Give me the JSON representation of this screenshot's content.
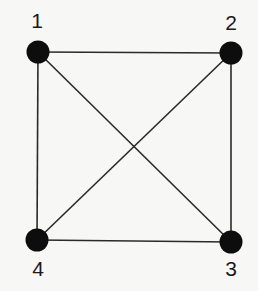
{
  "diagram": {
    "type": "graph",
    "nodes": [
      {
        "id": "1",
        "label": "1",
        "x": 38,
        "y": 52,
        "label_x": 37,
        "label_y": 28
      },
      {
        "id": "2",
        "label": "2",
        "x": 231,
        "y": 53,
        "label_x": 231,
        "label_y": 30
      },
      {
        "id": "3",
        "label": "3",
        "x": 231,
        "y": 242,
        "label_x": 231,
        "label_y": 276
      },
      {
        "id": "4",
        "label": "4",
        "x": 37,
        "y": 240,
        "label_x": 38,
        "label_y": 276
      }
    ],
    "edges": [
      {
        "from": "1",
        "to": "2"
      },
      {
        "from": "2",
        "to": "3"
      },
      {
        "from": "3",
        "to": "4"
      },
      {
        "from": "4",
        "to": "1"
      },
      {
        "from": "1",
        "to": "3"
      },
      {
        "from": "2",
        "to": "4"
      }
    ],
    "colors": {
      "node": "#0d0d0d",
      "edge": "#2a2a2a",
      "background": "#f7f7f5"
    }
  }
}
